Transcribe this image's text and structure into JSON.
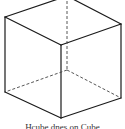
{
  "figure": {
    "type": "wireframe-cube",
    "caption": "Hcube dnes on Cube",
    "colors": {
      "line": "#1a1a1a",
      "background": "#ffffff",
      "caption": "#333333"
    },
    "vertices": {
      "top_back": [
        67,
        -4
      ],
      "top_left": [
        5,
        17
      ],
      "top_right": [
        121,
        24
      ],
      "front_top": [
        61,
        45
      ],
      "hidden_center": [
        67,
        70
      ],
      "bottom_left": [
        5,
        92
      ],
      "bottom_right": [
        121,
        98
      ],
      "front_bottom": [
        61,
        118
      ]
    },
    "solid_edges": [
      [
        "top_back",
        "top_left"
      ],
      [
        "top_back",
        "top_right"
      ],
      [
        "top_left",
        "front_top"
      ],
      [
        "top_right",
        "front_top"
      ],
      [
        "top_left",
        "bottom_left"
      ],
      [
        "top_right",
        "bottom_right"
      ],
      [
        "front_top",
        "front_bottom"
      ],
      [
        "bottom_left",
        "front_bottom"
      ],
      [
        "bottom_right",
        "front_bottom"
      ]
    ],
    "dashed_edges": [
      [
        "top_back",
        "hidden_center"
      ],
      [
        "hidden_center",
        "bottom_left"
      ],
      [
        "hidden_center",
        "bottom_right"
      ]
    ]
  }
}
